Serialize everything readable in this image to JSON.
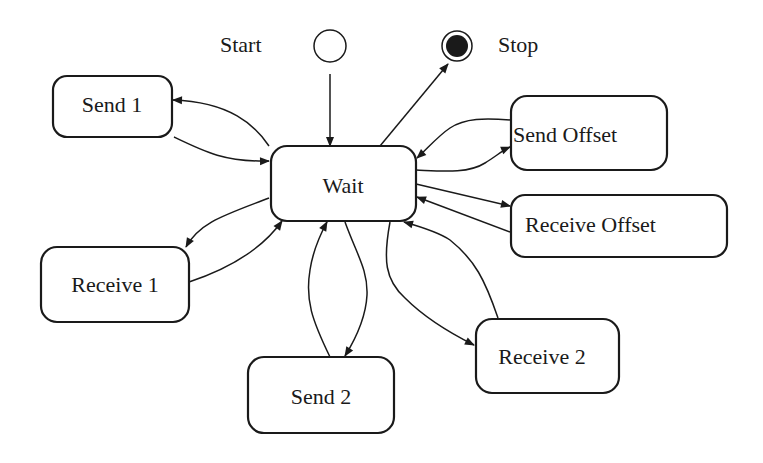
{
  "diagram": {
    "type": "state-machine",
    "start": {
      "label": "Start"
    },
    "stop": {
      "label": "Stop"
    },
    "states": [
      {
        "id": "wait",
        "label": "Wait"
      },
      {
        "id": "send1",
        "label": "Send 1"
      },
      {
        "id": "receive1",
        "label": "Receive 1"
      },
      {
        "id": "send2",
        "label": "Send 2"
      },
      {
        "id": "receive2",
        "label": "Receive 2"
      },
      {
        "id": "send_offset",
        "label": "Send Offset"
      },
      {
        "id": "receive_offset",
        "label": "Receive Offset"
      }
    ],
    "transitions": [
      {
        "from": "start",
        "to": "wait"
      },
      {
        "from": "wait",
        "to": "stop"
      },
      {
        "from": "wait",
        "to": "send1"
      },
      {
        "from": "send1",
        "to": "wait"
      },
      {
        "from": "wait",
        "to": "receive1"
      },
      {
        "from": "receive1",
        "to": "wait"
      },
      {
        "from": "wait",
        "to": "send2"
      },
      {
        "from": "send2",
        "to": "wait"
      },
      {
        "from": "wait",
        "to": "receive2"
      },
      {
        "from": "receive2",
        "to": "wait"
      },
      {
        "from": "wait",
        "to": "send_offset"
      },
      {
        "from": "send_offset",
        "to": "wait"
      },
      {
        "from": "wait",
        "to": "receive_offset"
      },
      {
        "from": "receive_offset",
        "to": "wait"
      }
    ]
  }
}
